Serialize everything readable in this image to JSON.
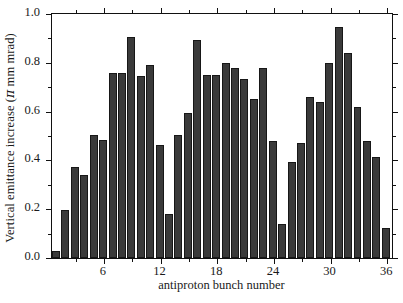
{
  "chart_data": {
    "type": "bar",
    "title": "",
    "xlabel": "antiproton bunch number",
    "ylabel": "Vertical emittance increase (π mm mrad)",
    "ylabel_parts": {
      "before": "Vertical emittance increase (",
      "symbol": "π",
      "after": " mm mrad)"
    },
    "xlim": [
      0.5,
      36.5
    ],
    "ylim": [
      0.0,
      1.0
    ],
    "grid": false,
    "legend": null,
    "bar_color": "#3a3a3a",
    "edge_color": "#171717",
    "axis_color": "#111111",
    "ytick_labels": [
      "0.0",
      "0.2",
      "0.4",
      "0.6",
      "0.8",
      "1.0"
    ],
    "ytick_values": [
      0.0,
      0.2,
      0.4,
      0.6,
      0.8,
      1.0
    ],
    "ytick_minor_values": [
      0.1,
      0.3,
      0.5,
      0.7,
      0.9
    ],
    "xtick_labels": [
      "6",
      "12",
      "18",
      "24",
      "30",
      "36"
    ],
    "xtick_values": [
      6,
      12,
      18,
      24,
      30,
      36
    ],
    "xtick_minor_values": [
      3,
      9,
      15,
      21,
      27,
      33
    ],
    "categories": [
      1,
      2,
      3,
      4,
      5,
      6,
      7,
      8,
      9,
      10,
      11,
      12,
      13,
      14,
      15,
      16,
      17,
      18,
      19,
      20,
      21,
      22,
      23,
      24,
      25,
      26,
      27,
      28,
      29,
      30,
      31,
      32,
      33,
      34,
      35,
      36
    ],
    "values": [
      0.03,
      0.195,
      0.375,
      0.34,
      0.505,
      0.485,
      0.76,
      0.76,
      0.905,
      0.745,
      0.79,
      0.465,
      0.18,
      0.505,
      0.595,
      0.895,
      0.75,
      0.75,
      0.8,
      0.78,
      0.735,
      0.65,
      0.78,
      0.48,
      0.14,
      0.395,
      0.47,
      0.66,
      0.64,
      0.8,
      0.945,
      0.84,
      0.62,
      0.48,
      0.415,
      0.125
    ]
  }
}
